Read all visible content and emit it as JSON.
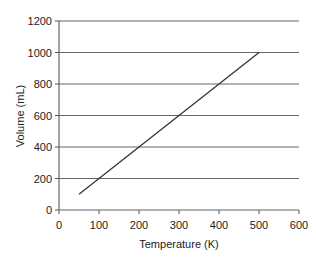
{
  "chart_data": {
    "type": "line",
    "title": "",
    "xlabel": "Temperature (K)",
    "ylabel": "Volume (mL)",
    "xlim": [
      0,
      600
    ],
    "ylim": [
      0,
      1200
    ],
    "x_ticks": [
      "0",
      "100",
      "200",
      "300",
      "400",
      "500",
      "600"
    ],
    "y_ticks": [
      "0",
      "200",
      "400",
      "600",
      "800",
      "1000",
      "1200"
    ],
    "grid": "horizontal",
    "legend": "none",
    "series": [
      {
        "name": "Volume vs Temperature",
        "x": [
          50,
          500
        ],
        "y": [
          100,
          1000
        ],
        "color": "#333333"
      }
    ]
  }
}
